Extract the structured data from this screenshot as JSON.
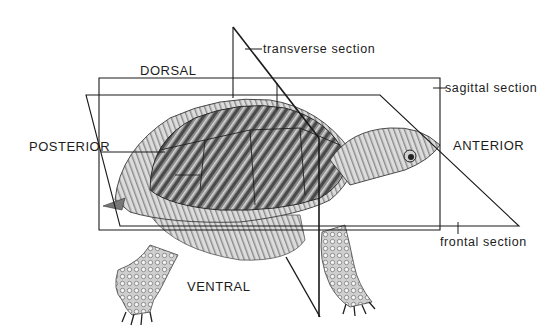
{
  "diagram": {
    "orientation_labels": {
      "dorsal": "DORSAL",
      "ventral": "VENTRAL",
      "anterior": "ANTERIOR",
      "posterior": "POSTERIOR"
    },
    "section_labels": {
      "transverse": "transverse section",
      "sagittal": "sagittal section",
      "frontal": "frontal section"
    },
    "colors": {
      "background": "#ffffff",
      "line": "#1a1a1a",
      "shell_dark": "#5a5a5a",
      "shell_mid": "#9a9a9a",
      "shell_light": "#d6d6d6"
    }
  }
}
